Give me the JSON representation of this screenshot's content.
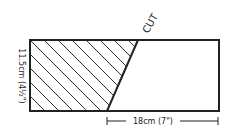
{
  "diagram": {
    "cut_label": "CUT",
    "height_label": "11.5cm (4½\")",
    "width_label": "18cm (7\")",
    "colors": {
      "stroke": "#222222",
      "background": "#ffffff"
    }
  }
}
